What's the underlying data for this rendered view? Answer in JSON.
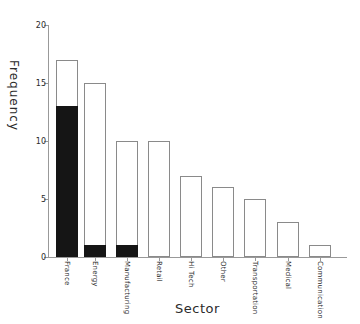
{
  "chart_data": {
    "type": "bar",
    "title": "",
    "xlabel": "Sector",
    "ylabel": "Frequency",
    "categories": [
      "France",
      "Energy",
      "Manufacturing",
      "Retail",
      "Hi Tech",
      "Other",
      "Transportation",
      "Medical",
      "Communication"
    ],
    "series": [
      {
        "name": "total",
        "values": [
          17,
          15,
          10,
          10,
          7,
          6,
          5,
          3,
          1
        ],
        "fill": "#ffffff",
        "outline": "#8a8a8a"
      },
      {
        "name": "highlighted-subset",
        "values": [
          13,
          1,
          1,
          0,
          0,
          0,
          0,
          0,
          0
        ],
        "fill": "#151515",
        "outline": "#151515"
      }
    ],
    "ylim": [
      0,
      20
    ],
    "yticks": [
      "0",
      "5",
      "10",
      "15",
      "20"
    ],
    "grid": false,
    "legend": "none",
    "axis_color": "#999999",
    "text_color": "#2b2b2b"
  }
}
